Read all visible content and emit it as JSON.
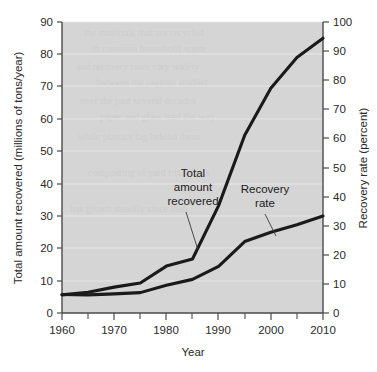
{
  "chart_data": {
    "type": "line",
    "title": "",
    "xlabel": "Year",
    "ylabel": "Total amount recovered (millions of tons/year)",
    "y2label": "Recovery rate (percent)",
    "xlim": [
      1960,
      2010
    ],
    "ylim": [
      0,
      90
    ],
    "y2lim": [
      0,
      100
    ],
    "grid": true,
    "legend_position": "inline-annotations",
    "x_ticks": [
      1960,
      1970,
      1980,
      1990,
      2000,
      2010
    ],
    "x_minor_ticks": [
      1965,
      1975,
      1985,
      1995,
      2005
    ],
    "y_ticks": [
      0,
      10,
      20,
      30,
      40,
      50,
      60,
      70,
      80,
      90
    ],
    "y2_ticks": [
      0,
      10,
      20,
      30,
      40,
      50,
      60,
      70,
      80,
      90,
      100
    ],
    "series": [
      {
        "name": "Total amount recovered",
        "axis": "left",
        "units": "millions of tons/year",
        "x": [
          1960,
          1965,
          1970,
          1975,
          1980,
          1985,
          1990,
          1995,
          2000,
          2005,
          2010
        ],
        "values": [
          5.6,
          6.4,
          8.0,
          9.3,
          14.5,
          16.7,
          33.2,
          55.0,
          69.5,
          79.0,
          85.0
        ]
      },
      {
        "name": "Recovery rate",
        "axis": "right",
        "units": "percent",
        "x": [
          1960,
          1965,
          1970,
          1975,
          1980,
          1985,
          1990,
          1995,
          2000,
          2005,
          2010
        ],
        "values": [
          6.4,
          6.2,
          6.6,
          7.0,
          9.6,
          11.6,
          16.0,
          25.7,
          29.0,
          31.5,
          34.2
        ],
        "values_left_scale": [
          5.7,
          5.6,
          5.9,
          6.3,
          8.6,
          10.4,
          14.4,
          22.1,
          25.0,
          27.3,
          30.0
        ]
      }
    ],
    "annotations": [
      {
        "name": "total-amount-recovered",
        "lines": [
          "Total",
          "amount",
          "recovered"
        ],
        "text": "Total amount recovered"
      },
      {
        "name": "recovery-rate",
        "lines": [
          "Recovery",
          "rate"
        ],
        "text": "Recovery rate"
      }
    ]
  },
  "colors": {
    "plot_background": "#d5d5d5",
    "line": "#1a1a1a",
    "gridline": "#eaeaea",
    "axis": "#4a4a4a",
    "page_background": "#ffffff"
  }
}
